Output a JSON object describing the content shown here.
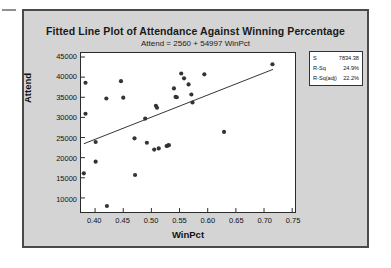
{
  "chart_data": {
    "type": "scatter",
    "title": "Fitted Line Plot of Attendance Against Winning Percentage",
    "subtitle": "Attend =  2560 + 54997 WinPct",
    "xlabel": "WinPct",
    "ylabel": "Attend",
    "xlim": [
      0.375,
      0.755
    ],
    "ylim": [
      6500,
      46000
    ],
    "xticks": [
      "0.40",
      "0.45",
      "0.50",
      "0.55",
      "0.60",
      "0.65",
      "0.70",
      "0.75"
    ],
    "xtick_values": [
      0.4,
      0.45,
      0.5,
      0.55,
      0.6,
      0.65,
      0.7,
      0.75
    ],
    "yticks": [
      "10000",
      "15000",
      "20000",
      "25000",
      "30000",
      "35000",
      "40000",
      "45000"
    ],
    "ytick_values": [
      10000,
      15000,
      20000,
      25000,
      30000,
      35000,
      40000,
      45000
    ],
    "grid": false,
    "legend_position": "upper-right-outside",
    "marker_color": "#333333",
    "line_color": "#333333",
    "plot_background": "#ffffff",
    "page_background": "#d4d4d4",
    "series": [
      {
        "name": "Attend",
        "type": "scatter",
        "points": [
          [
            0.383,
            38600
          ],
          [
            0.383,
            30900
          ],
          [
            0.38,
            16100
          ],
          [
            0.401,
            23900
          ],
          [
            0.401,
            19000
          ],
          [
            0.42,
            34700
          ],
          [
            0.421,
            8000
          ],
          [
            0.446,
            39000
          ],
          [
            0.45,
            34900
          ],
          [
            0.47,
            24800
          ],
          [
            0.471,
            15700
          ],
          [
            0.489,
            29700
          ],
          [
            0.492,
            23700
          ],
          [
            0.505,
            22000
          ],
          [
            0.508,
            32900
          ],
          [
            0.51,
            32400
          ],
          [
            0.513,
            22300
          ],
          [
            0.527,
            22900
          ],
          [
            0.529,
            23000
          ],
          [
            0.531,
            23100
          ],
          [
            0.54,
            37200
          ],
          [
            0.543,
            35100
          ],
          [
            0.545,
            35000
          ],
          [
            0.553,
            40900
          ],
          [
            0.558,
            39700
          ],
          [
            0.566,
            38200
          ],
          [
            0.571,
            35700
          ],
          [
            0.573,
            33700
          ],
          [
            0.594,
            40700
          ],
          [
            0.629,
            26400
          ],
          [
            0.715,
            43200
          ]
        ]
      },
      {
        "name": "Fitted Line",
        "type": "line",
        "equation": "Attend = 2560 + 54997 WinPct",
        "intercept": 2560,
        "slope": 54997,
        "x_start": 0.38,
        "x_end": 0.716
      }
    ],
    "annotations": {
      "stats": [
        {
          "label": "S",
          "value": "7834.38"
        },
        {
          "label": "R-Sq",
          "value": "24.9%"
        },
        {
          "label": "R-Sq(adj)",
          "value": "22.2%"
        }
      ]
    }
  }
}
